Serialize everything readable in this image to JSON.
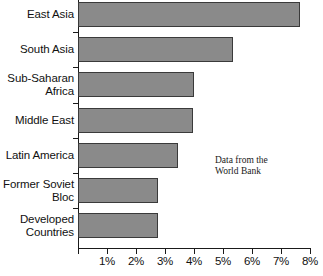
{
  "chart_data": {
    "type": "bar",
    "orientation": "horizontal",
    "title": "",
    "xlabel": "",
    "ylabel": "",
    "xlim": [
      0,
      8
    ],
    "grid": false,
    "legend": null,
    "categories": [
      "East Asia",
      "South Asia",
      "Sub-Saharan\nAfrica",
      "Middle East",
      "Latin America",
      "Former Soviet\nBloc",
      "Developed\nCountries"
    ],
    "values": [
      7.65,
      5.35,
      4.0,
      3.95,
      3.45,
      2.75,
      2.75
    ],
    "xticks": [
      0,
      1,
      2,
      3,
      4,
      5,
      6,
      7,
      8
    ],
    "xtick_labels": [
      "",
      "1%",
      "2%",
      "3%",
      "4%",
      "5%",
      "6%",
      "7%",
      "8%"
    ],
    "annotations": [
      {
        "text": "Data from the\nWorld Bank"
      }
    ],
    "colors": {
      "bar_fill": "#8a8a8a",
      "bar_border": "#3a3a3a",
      "axis": "#1a1a1a",
      "text": "#111111",
      "background": "#ffffff"
    }
  }
}
